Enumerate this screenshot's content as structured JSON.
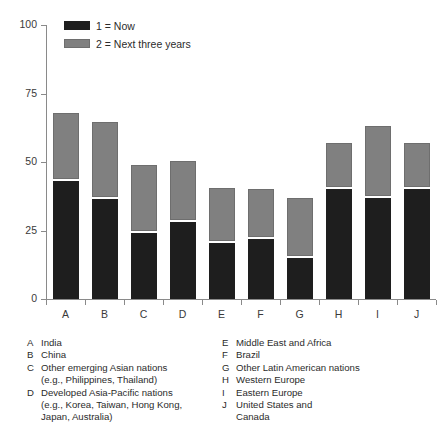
{
  "chart_data": {
    "type": "bar",
    "title": "",
    "subtitle": "",
    "xlabel": "",
    "ylabel": "Percent",
    "ylim": [
      0,
      100
    ],
    "yticks": [
      0,
      25,
      50,
      75,
      100
    ],
    "ytick_labels": [
      "0",
      "25",
      "50",
      "75",
      "100"
    ],
    "grid": false,
    "stacked": true,
    "legend_position": "top-left",
    "categories": [
      "A",
      "B",
      "C",
      "D",
      "E",
      "F",
      "G",
      "H",
      "I",
      "J"
    ],
    "category_names": [
      "India",
      "China",
      "Other emerging Asian nations (e.g., Philippines, Thailand)",
      "Developed Asia-Pacific nations (e.g., Korea, Taiwan, Hong Kong, Japan, Australia)",
      "Middle East and Africa",
      "Brazil",
      "Other Latin American nations",
      "Western Europe",
      "Eastern Europe",
      "United States and Canada"
    ],
    "series": [
      {
        "name": "Now",
        "key": "1",
        "color": "#1e1e1e",
        "values": [
          43,
          36.5,
          24,
          28,
          20.5,
          22,
          15,
          40,
          37,
          40
        ]
      },
      {
        "name": "Next three years",
        "key": "2",
        "color": "#808080",
        "values": [
          25,
          28,
          25,
          22.5,
          20,
          18,
          22,
          17,
          26,
          17
        ]
      }
    ],
    "totals": [
      68,
      64.5,
      49,
      50.5,
      40.5,
      40,
      37,
      57,
      63,
      57
    ]
  },
  "legend": {
    "items": [
      {
        "label": "1  =  Now",
        "swatch": "dark-swatch"
      },
      {
        "label": "2  =  Next three years",
        "swatch": "gray-swatch"
      }
    ]
  },
  "key": {
    "left": [
      {
        "letter": "A",
        "lines": [
          "India"
        ]
      },
      {
        "letter": "B",
        "lines": [
          "China"
        ]
      },
      {
        "letter": "C",
        "lines": [
          "Other emerging Asian nations",
          "(e.g., Philippines, Thailand)"
        ]
      },
      {
        "letter": "D",
        "lines": [
          "Developed Asia-Pacific nations",
          "(e.g., Korea, Taiwan, Hong Kong,",
          "Japan, Australia)"
        ]
      }
    ],
    "right": [
      {
        "letter": "E",
        "lines": [
          "Middle East and Africa"
        ]
      },
      {
        "letter": "F",
        "lines": [
          "Brazil"
        ]
      },
      {
        "letter": "G",
        "lines": [
          "Other Latin American nations"
        ]
      },
      {
        "letter": "H",
        "lines": [
          "Western Europe"
        ]
      },
      {
        "letter": "I",
        "lines": [
          "Eastern Europe"
        ]
      },
      {
        "letter": "J",
        "lines": [
          "United States and",
          "Canada"
        ]
      }
    ]
  },
  "colors": {
    "now": "#1e1e1e",
    "next": "#808080",
    "axis": "#8a8a8a",
    "text": "#2b2b2b",
    "background": "#ffffff"
  }
}
